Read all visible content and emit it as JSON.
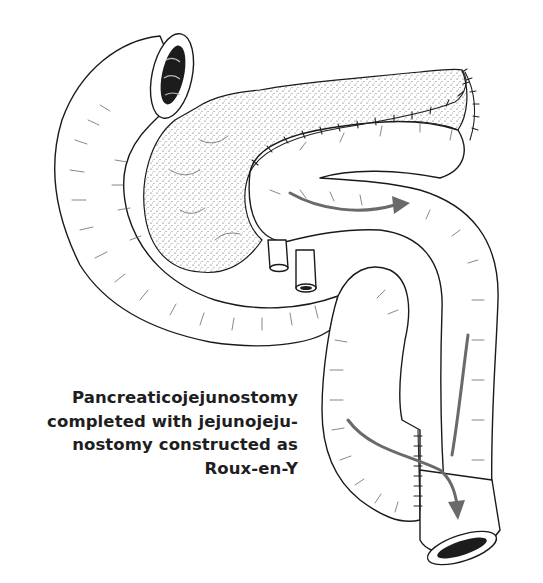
{
  "figure": {
    "caption_lines": [
      "Pancreaticojejunostomy",
      "completed with jejunojeju-",
      "nostomy constructed as",
      "Roux-en-Y"
    ],
    "colors": {
      "background": "#ffffff",
      "ink": "#1a1a1a",
      "caption": "#1e1e1e",
      "arrow": "#6a6a6a"
    }
  }
}
